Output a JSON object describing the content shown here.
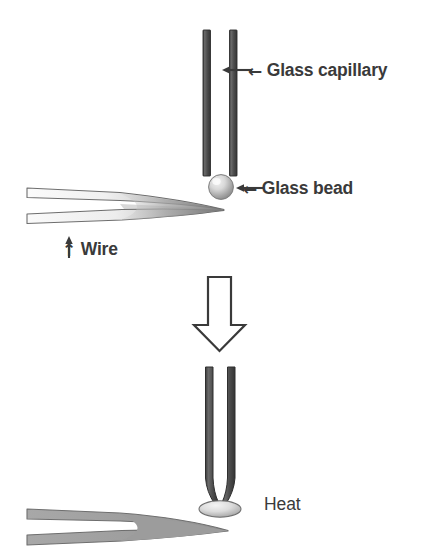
{
  "figure": {
    "background_color": "#ffffff",
    "width": 432,
    "height": 560
  },
  "colors": {
    "ink": "#3a3a3a",
    "capillary_dark": "#555555",
    "capillary_edge": "#2e2e2e",
    "bead_light": "#e8e8e8",
    "bead_mid": "#b4b4b4",
    "bead_shadow": "#8a8a8a",
    "wire_gray": "#9a9a9a",
    "wire_outline": "#6e6e6e",
    "arrow_outline": "#3a3a3a",
    "arrow_fill": "#ffffff"
  },
  "panels": {
    "top": {
      "name": "before-heating",
      "elements": {
        "capillary": {
          "icon": "glass-capillary-tube",
          "state": "open straight tube"
        },
        "bead": {
          "icon": "glass-bead-sphere",
          "state": "spherical"
        },
        "wire": {
          "icon": "wire-tweezers",
          "state": "tapered forceps holding bead"
        }
      },
      "labels": {
        "capillary": {
          "arrow": "←",
          "text": "Glass capillary"
        },
        "bead": {
          "arrow": "←",
          "text": "Glass bead"
        },
        "wire": {
          "arrow": "↑",
          "text": "Wire"
        }
      }
    },
    "transition": {
      "name": "process-arrow",
      "icon": "down-block-arrow",
      "direction": "down"
    },
    "bottom": {
      "name": "after-heating",
      "elements": {
        "capillary": {
          "icon": "glass-capillary-tube-fused",
          "state": "tapered, sealed tip"
        },
        "bead": {
          "icon": "glass-bead-flattened",
          "state": "melted ellipse"
        },
        "wire": {
          "icon": "wire-tweezers",
          "state": "tapered forceps"
        }
      },
      "labels": {
        "heat": {
          "text": "Heat"
        }
      }
    }
  }
}
